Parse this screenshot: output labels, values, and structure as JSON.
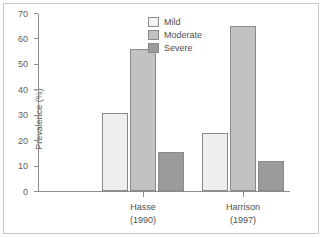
{
  "chart_data": {
    "type": "bar",
    "title": "",
    "xlabel": "",
    "ylabel": "Prevalence (%)",
    "ylim": [
      0,
      70
    ],
    "yticks": [
      0,
      10,
      20,
      30,
      40,
      50,
      60,
      70
    ],
    "ytick_labels": [
      "0",
      "10",
      "20",
      "30",
      "40",
      "50",
      "60",
      "70"
    ],
    "grid": false,
    "legend_position": "top-center",
    "categories": [
      "Hasse\n(1990)",
      "Harrison\n(1997)"
    ],
    "category_labels": [
      {
        "name": "Hasse",
        "year": "(1990)"
      },
      {
        "name": "Harrison",
        "year": "(1997)"
      }
    ],
    "series": [
      {
        "name": "Mild",
        "color": "#efefef",
        "values": [
          30.5,
          23
        ]
      },
      {
        "name": "Moderate",
        "color": "#c2c2c2",
        "values": [
          56,
          65
        ]
      },
      {
        "name": "Severe",
        "color": "#9b9b9b",
        "values": [
          15.5,
          12
        ]
      }
    ]
  },
  "legend": {
    "items": [
      {
        "label": "Mild"
      },
      {
        "label": "Moderate"
      },
      {
        "label": "Severe"
      }
    ]
  },
  "colors": {
    "axis": "#8d8d8d",
    "text": "#4f4f4f",
    "frame": "#c9c9c9",
    "bar_outline": "#8a8a8a",
    "background": "#ffffff"
  }
}
